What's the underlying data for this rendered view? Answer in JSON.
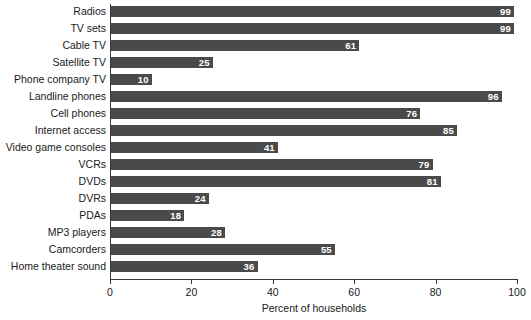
{
  "chart_data": {
    "type": "bar",
    "orientation": "horizontal",
    "title": "",
    "xlabel": "Percent of households",
    "ylabel": "",
    "xlim": [
      0,
      100
    ],
    "xticks": [
      0,
      20,
      40,
      60,
      80,
      100
    ],
    "grid": false,
    "legend": null,
    "bar_color": "#4a4a4a",
    "value_label_color": "#ffffff",
    "categories": [
      "Radios",
      "TV sets",
      "Cable TV",
      "Satellite TV",
      "Phone company TV",
      "Landline phones",
      "Cell phones",
      "Internet access",
      "Video game consoles",
      "VCRs",
      "DVDs",
      "DVRs",
      "PDAs",
      "MP3 players",
      "Camcorders",
      "Home theater sound"
    ],
    "values": [
      99,
      99,
      61,
      25,
      10,
      96,
      76,
      85,
      41,
      79,
      81,
      24,
      18,
      28,
      55,
      36
    ]
  }
}
